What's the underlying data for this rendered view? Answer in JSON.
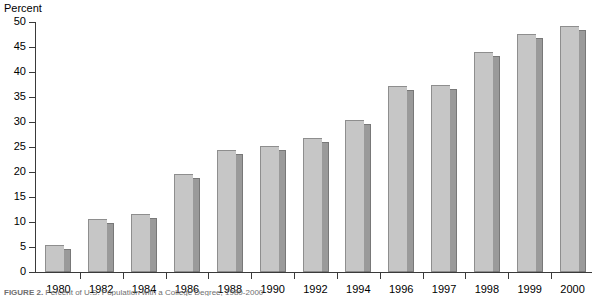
{
  "axis": {
    "ylabel": "Percent",
    "yticks": [
      0,
      5,
      10,
      15,
      20,
      25,
      30,
      35,
      40,
      45,
      50
    ]
  },
  "caption": {
    "prefix": "FIGURE 2.",
    "rest": "Percent of U.S. Population with a College Degree, 1980-2000"
  },
  "chart_data": {
    "type": "bar",
    "title": "",
    "subtitle": "",
    "xlabel": "",
    "ylabel": "Percent",
    "ylim": [
      0,
      50
    ],
    "ytick_step": 5,
    "grid": false,
    "legend": "none",
    "categories": [
      "1980",
      "1982",
      "1984",
      "1986",
      "1988",
      "1990",
      "1992",
      "1994",
      "1996",
      "1997",
      "1998",
      "1999",
      "2000"
    ],
    "values": [
      5.5,
      10.7,
      11.7,
      19.6,
      24.4,
      25.2,
      26.8,
      30.4,
      37.2,
      37.4,
      44.0,
      47.6,
      49.3
    ],
    "series": [
      {
        "name": "Percent",
        "values": [
          5.5,
          10.7,
          11.7,
          19.6,
          24.4,
          25.2,
          26.8,
          30.4,
          37.2,
          37.4,
          44.0,
          47.6,
          49.3
        ]
      }
    ],
    "bar_face_color": "#c6c6c6",
    "bar_side_color": "#9a9a9a",
    "axis_color": "#3a3a3a"
  }
}
